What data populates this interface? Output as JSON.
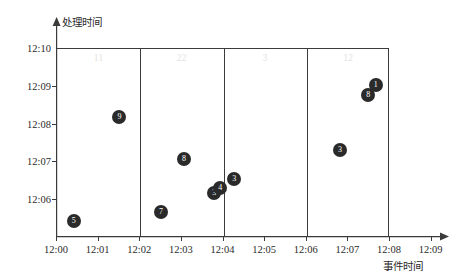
{
  "chart_data": {
    "type": "scatter",
    "title": "",
    "xlabel": "事件时间",
    "ylabel": "处理时间",
    "xlim": [
      "12:00",
      "12:09"
    ],
    "ylim": [
      "12:05",
      "12:10"
    ],
    "plot_xlim": [
      "12:00",
      "12:08"
    ],
    "grid": false,
    "legend": "none",
    "xticks": [
      "12:00",
      "12:01",
      "12:02",
      "12:03",
      "12:04",
      "12:05",
      "12:06",
      "12:07",
      "12:08",
      "12:09"
    ],
    "yticks": [
      "12:06",
      "12:07",
      "12:08",
      "12:09",
      "12:10"
    ],
    "sections": [
      {
        "label": "11",
        "start": "12:00",
        "end": "12:02"
      },
      {
        "label": "22",
        "start": "12:02",
        "end": "12:04"
      },
      {
        "label": "3",
        "start": "12:04",
        "end": "12:06"
      },
      {
        "label": "12",
        "start": "12:06",
        "end": "12:08"
      }
    ],
    "section_divider_positions": [
      "12:02",
      "12:04",
      "12:06"
    ],
    "points": [
      {
        "label": "5",
        "x": 0.4,
        "y": 5.45
      },
      {
        "label": "9",
        "x": 1.5,
        "y": 8.2
      },
      {
        "label": "7",
        "x": 2.5,
        "y": 5.7
      },
      {
        "label": "8",
        "x": 3.05,
        "y": 7.1
      },
      {
        "label": "3",
        "x": 3.78,
        "y": 6.18
      },
      {
        "label": "4",
        "x": 3.92,
        "y": 6.32
      },
      {
        "label": "3",
        "x": 4.26,
        "y": 6.56
      },
      {
        "label": "3",
        "x": 6.8,
        "y": 7.32
      },
      {
        "label": "8",
        "x": 7.48,
        "y": 8.78
      },
      {
        "label": "1",
        "x": 7.66,
        "y": 9.06
      }
    ],
    "colors": {
      "marker": "#2a2a2a",
      "marker_text": "#ffffff",
      "axis": "#3b3b3b",
      "tick_text": "#2b2b2b",
      "section_label": "#e2e2e2",
      "background": "#ffffff"
    }
  }
}
